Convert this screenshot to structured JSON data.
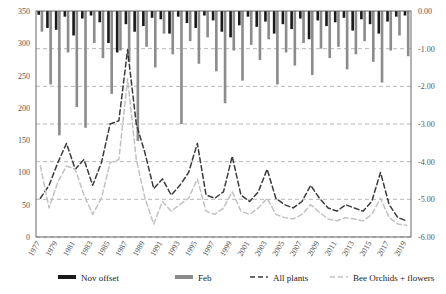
{
  "chart_data": {
    "type": "bar",
    "title": "",
    "subtitle": "",
    "xlabel": "",
    "ylabel": "",
    "y2label": "",
    "grid": true,
    "legend_position": "bottom",
    "x": [
      1977,
      1978,
      1979,
      1980,
      1981,
      1982,
      1983,
      1984,
      1985,
      1986,
      1987,
      1988,
      1989,
      1990,
      1991,
      1992,
      1993,
      1994,
      1995,
      1996,
      1997,
      1998,
      1999,
      2000,
      2001,
      2002,
      2003,
      2004,
      2005,
      2006,
      2007,
      2008,
      2009,
      2010,
      2011,
      2012,
      2013,
      2014,
      2015,
      2016,
      2017,
      2018,
      2019
    ],
    "xtick_labels": [
      "1977",
      "1979",
      "1981",
      "1983",
      "1985",
      "1987",
      "1989",
      "1991",
      "1993",
      "1995",
      "1997",
      "1999",
      "2001",
      "2003",
      "2005",
      "2007",
      "2009",
      "2011",
      "2013",
      "2015",
      "2017",
      "2019"
    ],
    "ylim": [
      0,
      350
    ],
    "ytick_labels": [
      "0",
      "50",
      "100",
      "150",
      "200",
      "250",
      "300",
      "350"
    ],
    "ytick_values": [
      0,
      50,
      100,
      150,
      200,
      250,
      300,
      350
    ],
    "y2lim": [
      -6.0,
      0.0
    ],
    "y2tick_labels": [
      "0.00",
      "-1.00",
      "-2.00",
      "-3.00",
      "-4.00",
      "-5.00",
      "-6.00"
    ],
    "y2tick_values": [
      0.0,
      -1.0,
      -2.0,
      -3.0,
      -4.0,
      -5.0,
      -6.0
    ],
    "series": [
      {
        "name": "Nov offset",
        "type": "bar",
        "axis": "right",
        "color": "#1a1a1a",
        "values": [
          -0.1,
          -0.45,
          -0.5,
          -0.15,
          -0.65,
          -0.2,
          -0.12,
          -0.3,
          -0.85,
          -1.1,
          -0.35,
          -0.55,
          -0.4,
          -0.18,
          -0.22,
          -0.6,
          -0.15,
          -0.32,
          -0.45,
          -0.12,
          -0.25,
          -0.55,
          -0.7,
          -0.38,
          -0.15,
          -0.42,
          -0.28,
          -0.6,
          -0.35,
          -0.48,
          -0.2,
          -0.75,
          -0.25,
          -0.4,
          -0.3,
          -0.18,
          -0.52,
          -0.22,
          -0.35,
          -0.6,
          -0.28,
          -0.15,
          -0.12
        ]
      },
      {
        "name": "Feb",
        "type": "bar",
        "axis": "right",
        "color": "#8c8c8c",
        "values": [
          -0.55,
          -1.95,
          -3.3,
          -1.1,
          -2.55,
          -3.1,
          -0.85,
          -1.25,
          -2.2,
          -1.05,
          -1.35,
          -3.45,
          -0.95,
          -1.5,
          -0.6,
          -1.15,
          -3.0,
          -0.8,
          -1.4,
          -0.7,
          -1.6,
          -2.45,
          -1.05,
          -1.85,
          -0.9,
          -1.3,
          -0.75,
          -1.95,
          -1.1,
          -1.45,
          -0.85,
          -1.7,
          -1.0,
          -1.25,
          -0.95,
          -1.55,
          -1.15,
          -0.8,
          -1.35,
          -1.9,
          -1.05,
          -0.65,
          -1.2
        ]
      },
      {
        "name": "All plants",
        "type": "line",
        "axis": "left",
        "color": "#3a3a3a",
        "dashed": true,
        "values": [
          60,
          80,
          115,
          145,
          105,
          120,
          80,
          115,
          175,
          180,
          290,
          175,
          130,
          75,
          90,
          65,
          80,
          100,
          145,
          65,
          60,
          70,
          125,
          65,
          55,
          70,
          105,
          60,
          50,
          45,
          55,
          80,
          60,
          45,
          40,
          50,
          45,
          40,
          55,
          100,
          50,
          30,
          25
        ]
      },
      {
        "name": "Bee Orchids + flowers",
        "type": "line",
        "axis": "left",
        "color": "#c2c2c2",
        "dashed": true,
        "values": [
          110,
          45,
          85,
          110,
          105,
          65,
          35,
          60,
          115,
          120,
          245,
          120,
          60,
          20,
          55,
          40,
          50,
          60,
          90,
          40,
          35,
          45,
          70,
          40,
          35,
          45,
          60,
          35,
          30,
          28,
          35,
          50,
          38,
          28,
          25,
          30,
          28,
          25,
          35,
          60,
          30,
          20,
          18
        ]
      }
    ]
  },
  "legend": {
    "items": [
      {
        "label": "Nov offset",
        "marker": "bar-dark",
        "color": "#1a1a1a"
      },
      {
        "label": "Feb",
        "marker": "bar-gray",
        "color": "#8c8c8c"
      },
      {
        "label": "All plants",
        "marker": "line-dashed-dark",
        "color": "#3a3a3a"
      },
      {
        "label": "Bee Orchids + flowers",
        "marker": "line-dashed-light",
        "color": "#c2c2c2"
      }
    ]
  }
}
